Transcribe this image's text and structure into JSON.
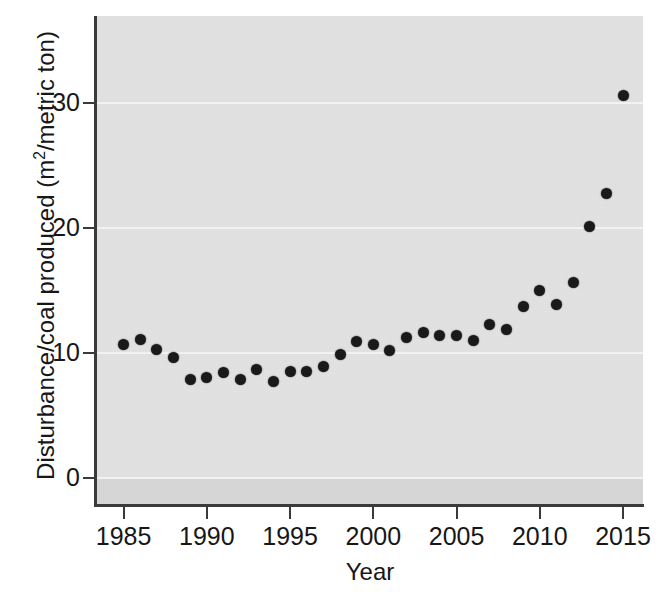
{
  "chart_data": {
    "type": "scatter",
    "title": "",
    "xlabel": "Year",
    "ylabel": "Disturbance/coal produced (m2/metric ton)",
    "ylabel_parts": {
      "prefix": "Disturbance/coal produced (m",
      "superscript": "2",
      "suffix": "/metric ton)"
    },
    "xlim": [
      1983.4,
      2016.2
    ],
    "ylim": [
      -2.2,
      37.0
    ],
    "grid": true,
    "grid_axis": "y",
    "legend": "none",
    "marker": "filled-circle",
    "marker_color": "#171717",
    "panel_color": "#e3e3e3",
    "gridline_color": "#f5f5f5",
    "xticks": [
      1985,
      1990,
      1995,
      2000,
      2005,
      2010,
      2015
    ],
    "xtick_labels": [
      "1985",
      "1990",
      "1995",
      "2000",
      "2005",
      "2010",
      "2015"
    ],
    "yticks": [
      0,
      10,
      20,
      30
    ],
    "ytick_labels": [
      "0",
      "10",
      "20",
      "30"
    ],
    "x": [
      1985,
      1986,
      1987,
      1988,
      1989,
      1990,
      1991,
      1992,
      1993,
      1994,
      1995,
      1996,
      1997,
      1998,
      1999,
      2000,
      2001,
      2002,
      2003,
      2004,
      2005,
      2006,
      2007,
      2008,
      2009,
      2010,
      2011,
      2012,
      2013,
      2014,
      2015
    ],
    "values": [
      10.7,
      11.1,
      10.3,
      9.6,
      7.9,
      8.0,
      8.4,
      7.9,
      8.7,
      7.7,
      8.5,
      8.5,
      8.9,
      9.9,
      10.9,
      10.7,
      10.2,
      11.2,
      11.6,
      11.4,
      11.4,
      11.0,
      12.3,
      11.9,
      13.7,
      15.0,
      13.9,
      15.6,
      20.1,
      22.8,
      30.6
    ]
  }
}
